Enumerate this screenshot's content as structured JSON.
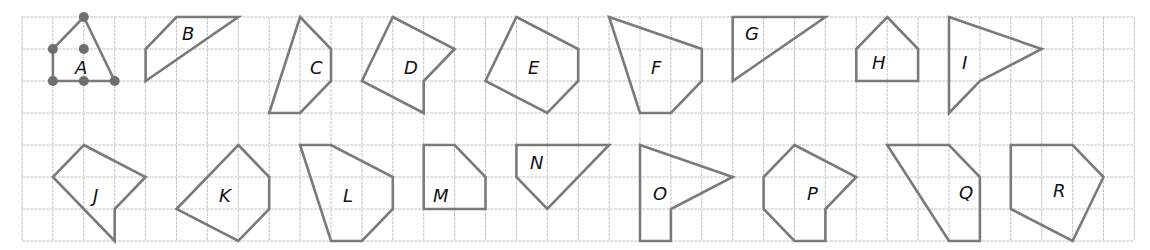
{
  "diagram": {
    "type": "grid-polygons",
    "grid": {
      "origin_px": [
        22,
        17
      ],
      "cell_px": [
        30.9,
        32
      ],
      "columns": 36,
      "rows": 7,
      "line_color": "#c4c4c4"
    },
    "stroke_color": "#7a7a7a",
    "dot_color": "#6f6f6f",
    "label_color": "#111111",
    "shapes": [
      {
        "label": "A",
        "vertices": [
          [
            2,
            0
          ],
          [
            3,
            2
          ],
          [
            1,
            2
          ],
          [
            1,
            1
          ]
        ],
        "label_pos": [
          75,
          74
        ],
        "dots": [
          [
            2,
            0
          ],
          [
            1,
            1
          ],
          [
            2,
            1
          ],
          [
            1,
            2
          ],
          [
            2,
            2
          ],
          [
            3,
            2
          ]
        ]
      },
      {
        "label": "B",
        "vertices": [
          [
            5,
            0
          ],
          [
            7,
            0
          ],
          [
            4,
            2
          ],
          [
            4,
            1
          ]
        ],
        "label_pos": [
          182,
          40
        ]
      },
      {
        "label": "C",
        "vertices": [
          [
            9,
            0
          ],
          [
            10,
            1
          ],
          [
            10,
            2
          ],
          [
            9,
            3
          ],
          [
            8,
            3
          ]
        ],
        "label_pos": [
          310,
          74
        ]
      },
      {
        "label": "D",
        "vertices": [
          [
            12,
            0
          ],
          [
            14,
            1
          ],
          [
            13,
            2
          ],
          [
            13,
            3
          ],
          [
            11,
            2
          ]
        ],
        "label_pos": [
          404,
          74
        ]
      },
      {
        "label": "E",
        "vertices": [
          [
            16,
            0
          ],
          [
            18,
            1
          ],
          [
            18,
            2
          ],
          [
            17,
            3
          ],
          [
            15,
            2
          ]
        ],
        "label_pos": [
          528,
          74
        ]
      },
      {
        "label": "F",
        "vertices": [
          [
            19,
            0
          ],
          [
            22,
            1
          ],
          [
            22,
            2
          ],
          [
            21,
            3
          ],
          [
            20,
            3
          ]
        ],
        "label_pos": [
          651,
          74
        ]
      },
      {
        "label": "G",
        "vertices": [
          [
            23,
            0
          ],
          [
            26,
            0
          ],
          [
            23,
            2
          ]
        ],
        "label_pos": [
          745,
          40
        ]
      },
      {
        "label": "H",
        "vertices": [
          [
            28,
            0
          ],
          [
            29,
            1
          ],
          [
            29,
            2
          ],
          [
            27,
            2
          ],
          [
            27,
            1
          ]
        ],
        "label_pos": [
          872,
          69
        ]
      },
      {
        "label": "I",
        "vertices": [
          [
            30,
            0
          ],
          [
            33,
            1
          ],
          [
            31,
            2
          ],
          [
            30,
            3
          ]
        ],
        "label_pos": [
          962,
          69
        ]
      },
      {
        "label": "J",
        "vertices": [
          [
            2,
            4
          ],
          [
            4,
            5
          ],
          [
            3,
            6
          ],
          [
            3,
            7
          ],
          [
            1,
            5
          ]
        ],
        "label_pos": [
          93,
          202
        ]
      },
      {
        "label": "K",
        "vertices": [
          [
            7,
            4
          ],
          [
            8,
            5
          ],
          [
            8,
            6
          ],
          [
            7,
            7
          ],
          [
            5,
            6
          ]
        ],
        "label_pos": [
          219,
          202
        ]
      },
      {
        "label": "L",
        "vertices": [
          [
            9,
            4
          ],
          [
            10,
            4
          ],
          [
            12,
            5
          ],
          [
            12,
            6
          ],
          [
            11,
            7
          ],
          [
            10,
            7
          ]
        ],
        "label_pos": [
          343,
          202
        ]
      },
      {
        "label": "M",
        "vertices": [
          [
            13,
            4
          ],
          [
            14,
            4
          ],
          [
            15,
            5
          ],
          [
            15,
            6
          ],
          [
            13,
            6
          ]
        ],
        "label_pos": [
          433,
          202
        ]
      },
      {
        "label": "N",
        "vertices": [
          [
            16,
            4
          ],
          [
            19,
            4
          ],
          [
            17,
            6
          ],
          [
            16,
            5
          ]
        ],
        "label_pos": [
          530,
          169
        ]
      },
      {
        "label": "O",
        "vertices": [
          [
            20,
            4
          ],
          [
            23,
            5
          ],
          [
            21,
            6
          ],
          [
            21,
            7
          ],
          [
            20,
            7
          ]
        ],
        "label_pos": [
          653,
          200
        ]
      },
      {
        "label": "P",
        "vertices": [
          [
            25,
            4
          ],
          [
            27,
            5
          ],
          [
            26,
            6
          ],
          [
            26,
            7
          ],
          [
            25,
            7
          ],
          [
            24,
            6
          ],
          [
            24,
            5
          ]
        ],
        "label_pos": [
          807,
          200
        ]
      },
      {
        "label": "Q",
        "vertices": [
          [
            28,
            4
          ],
          [
            30,
            4
          ],
          [
            31,
            5
          ],
          [
            31,
            7
          ],
          [
            30,
            7
          ]
        ],
        "label_pos": [
          959,
          199
        ]
      },
      {
        "label": "R",
        "vertices": [
          [
            32,
            4
          ],
          [
            34,
            4
          ],
          [
            35,
            5
          ],
          [
            34,
            7
          ],
          [
            32,
            6
          ]
        ],
        "label_pos": [
          1053,
          197
        ]
      }
    ]
  }
}
